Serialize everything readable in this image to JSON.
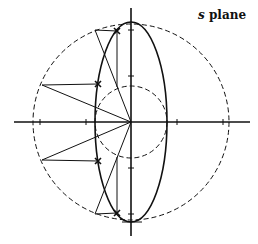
{
  "diagram": {
    "title_var": "s",
    "title_rest": " plane",
    "poles": [
      {
        "label": "pole-1",
        "upper": true
      },
      {
        "label": "pole-2",
        "upper": true
      },
      {
        "label": "pole-3",
        "upper": false
      },
      {
        "label": "pole-4",
        "upper": false
      }
    ],
    "elements": [
      "large dashed circle",
      "small dashed circle",
      "ellipse",
      "real axis",
      "imaginary axis"
    ],
    "colors": {
      "ink": "#111111",
      "background": "#ffffff"
    }
  }
}
